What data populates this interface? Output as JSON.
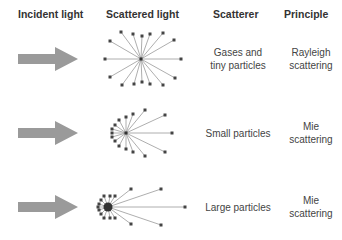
{
  "headers": {
    "incident": "Incident light",
    "scattered": "Scattered light",
    "scatterer": "Scatterer",
    "principle": "Principle"
  },
  "rows": [
    {
      "scatterer_line1": "Gases and",
      "scatterer_line2": "tiny particles",
      "principle_line1": "Rayleigh",
      "principle_line2": "scattering",
      "pattern": "symmetric"
    },
    {
      "scatterer_line1": "Small particles",
      "scatterer_line2": "",
      "principle_line1": "Mie",
      "principle_line2": "scattering",
      "pattern": "forward-biased"
    },
    {
      "scatterer_line1": "Large particles",
      "scatterer_line2": "",
      "principle_line1": "Mie",
      "principle_line2": "scattering",
      "pattern": "strongly-forward"
    }
  ],
  "colors": {
    "arrow": "#9a9a9a",
    "ray": "#999999",
    "particle": "#333333",
    "text": "#333333"
  },
  "icons": [
    "incident-arrow-icon",
    "scattering-pattern-icon"
  ]
}
